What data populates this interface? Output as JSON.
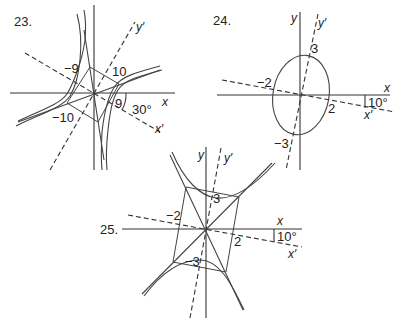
{
  "figure": {
    "panels": [
      {
        "id": "23",
        "number_label": "23.",
        "curve": "hyperbola (rotated)",
        "axes": {
          "x": "x",
          "y": "y",
          "x_rot": "x′",
          "y_rot": "y′"
        },
        "rotation_angle": "30°",
        "vertex_labels": [
          "9",
          "−9"
        ],
        "co_vertex_labels": [
          "10",
          "−10"
        ]
      },
      {
        "id": "24",
        "number_label": "24.",
        "curve": "ellipse (rotated)",
        "axes": {
          "x": "x",
          "y": "y",
          "x_rot": "x′",
          "y_rot": "y′"
        },
        "rotation_angle": "10°",
        "vertex_labels": [
          "3",
          "−3"
        ],
        "co_vertex_labels": [
          "2",
          "−2"
        ]
      },
      {
        "id": "25",
        "number_label": "25.",
        "curve": "hyperbola (rotated)",
        "axes": {
          "x": "x",
          "y": "y",
          "x_rot": "x′",
          "y_rot": "y′"
        },
        "rotation_angle": "10°",
        "vertex_labels": [
          "3",
          "−3"
        ],
        "co_vertex_labels": [
          "2",
          "−2"
        ]
      }
    ]
  }
}
